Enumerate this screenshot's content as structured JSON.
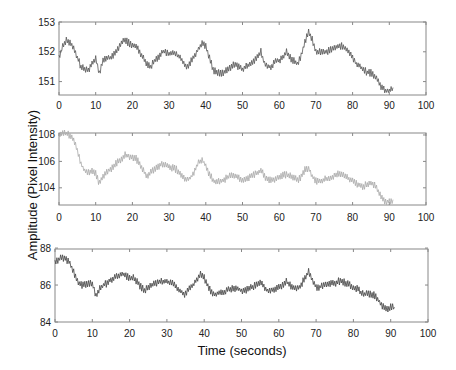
{
  "chart_data": [
    {
      "type": "line",
      "title": "",
      "xlabel": "",
      "ylabel": "",
      "xlim": [
        0,
        100
      ],
      "ylim": [
        150.6,
        153
      ],
      "xticks": [
        0,
        10,
        20,
        30,
        40,
        50,
        60,
        70,
        80,
        90,
        100
      ],
      "yticks": [
        151,
        152,
        153
      ],
      "grid": false,
      "color": "#555555",
      "series": [
        {
          "name": "signal-1",
          "x": [
            0,
            1,
            2,
            3,
            4,
            5,
            6,
            7,
            8,
            9,
            10,
            11,
            12,
            13,
            14,
            15,
            16,
            17,
            18,
            19,
            20,
            21,
            22,
            23,
            24,
            25,
            26,
            27,
            28,
            29,
            30,
            31,
            32,
            33,
            34,
            35,
            36,
            37,
            38,
            39,
            40,
            41,
            42,
            43,
            44,
            45,
            46,
            47,
            48,
            49,
            50,
            51,
            52,
            53,
            54,
            55,
            56,
            57,
            58,
            59,
            60,
            61,
            62,
            63,
            64,
            65,
            66,
            67,
            68,
            69,
            70,
            71,
            72,
            73,
            74,
            75,
            76,
            77,
            78,
            79,
            80,
            81,
            82,
            83,
            84,
            85,
            86,
            87,
            88,
            89,
            90,
            91
          ],
          "values": [
            151.8,
            152.2,
            152.4,
            152.3,
            152.1,
            151.8,
            151.5,
            151.4,
            151.4,
            151.6,
            151.8,
            151.3,
            151.7,
            151.8,
            151.8,
            151.9,
            152.1,
            152.3,
            152.4,
            152.3,
            152.2,
            152.2,
            152.0,
            151.8,
            151.6,
            151.5,
            151.7,
            151.8,
            152.0,
            152.0,
            151.9,
            152.0,
            151.9,
            151.8,
            151.6,
            151.5,
            151.7,
            151.9,
            152.1,
            152.3,
            152.2,
            151.8,
            151.4,
            151.3,
            151.3,
            151.3,
            151.4,
            151.5,
            151.6,
            151.5,
            151.4,
            151.5,
            151.6,
            151.7,
            151.8,
            152.0,
            151.6,
            151.5,
            151.5,
            151.7,
            151.7,
            151.8,
            152.0,
            151.8,
            151.7,
            151.6,
            151.9,
            152.3,
            152.7,
            152.4,
            152.0,
            152.0,
            152.0,
            152.0,
            152.1,
            152.1,
            152.2,
            152.2,
            152.1,
            152.0,
            151.8,
            151.6,
            151.5,
            151.4,
            151.3,
            151.3,
            151.2,
            151.0,
            150.8,
            150.7,
            150.7,
            150.8
          ]
        }
      ]
    },
    {
      "type": "line",
      "title": "",
      "xlabel": "",
      "ylabel": "",
      "xlim": [
        0,
        100
      ],
      "ylim": [
        102.8,
        108.2
      ],
      "xticks": [
        0,
        10,
        20,
        30,
        40,
        50,
        60,
        70,
        80,
        90,
        100
      ],
      "yticks": [
        104,
        106,
        108
      ],
      "grid": false,
      "color": "#aaaaaa",
      "series": [
        {
          "name": "signal-2",
          "x": [
            0,
            1,
            2,
            3,
            4,
            5,
            6,
            7,
            8,
            9,
            10,
            11,
            12,
            13,
            14,
            15,
            16,
            17,
            18,
            19,
            20,
            21,
            22,
            23,
            24,
            25,
            26,
            27,
            28,
            29,
            30,
            31,
            32,
            33,
            34,
            35,
            36,
            37,
            38,
            39,
            40,
            41,
            42,
            43,
            44,
            45,
            46,
            47,
            48,
            49,
            50,
            51,
            52,
            53,
            54,
            55,
            56,
            57,
            58,
            59,
            60,
            61,
            62,
            63,
            64,
            65,
            66,
            67,
            68,
            69,
            70,
            71,
            72,
            73,
            74,
            75,
            76,
            77,
            78,
            79,
            80,
            81,
            82,
            83,
            84,
            85,
            86,
            87,
            88,
            89,
            90,
            91
          ],
          "values": [
            108.0,
            108.1,
            108.1,
            108.0,
            107.6,
            106.8,
            105.8,
            105.3,
            105.2,
            105.3,
            105.1,
            104.3,
            104.9,
            105.2,
            105.4,
            105.7,
            106.0,
            106.2,
            106.5,
            106.4,
            106.3,
            106.2,
            105.8,
            105.3,
            104.9,
            105.2,
            105.4,
            105.6,
            105.8,
            105.7,
            105.6,
            105.5,
            105.4,
            105.1,
            104.8,
            104.6,
            104.8,
            105.3,
            105.9,
            106.1,
            105.7,
            105.0,
            104.6,
            104.4,
            104.5,
            104.6,
            104.8,
            105.0,
            104.9,
            104.7,
            104.6,
            104.7,
            104.8,
            105.0,
            105.1,
            105.3,
            104.9,
            104.6,
            104.6,
            104.7,
            104.8,
            105.0,
            105.0,
            104.9,
            104.8,
            104.6,
            104.8,
            105.4,
            105.5,
            104.9,
            104.5,
            104.5,
            104.6,
            104.7,
            104.8,
            104.9,
            105.1,
            105.0,
            104.9,
            104.7,
            104.5,
            104.3,
            104.2,
            104.1,
            104.3,
            104.4,
            104.2,
            103.7,
            103.2,
            102.9,
            103.0,
            103.1
          ]
        }
      ]
    },
    {
      "type": "line",
      "title": "",
      "xlabel": "Time (seconds)",
      "ylabel": "",
      "xlim": [
        0,
        100
      ],
      "ylim": [
        84,
        88
      ],
      "xticks": [
        0,
        10,
        20,
        30,
        40,
        50,
        60,
        70,
        80,
        90,
        100
      ],
      "yticks": [
        84,
        86,
        88
      ],
      "grid": false,
      "color": "#444444",
      "series": [
        {
          "name": "signal-3",
          "x": [
            0,
            1,
            2,
            3,
            4,
            5,
            6,
            7,
            8,
            9,
            10,
            11,
            12,
            13,
            14,
            15,
            16,
            17,
            18,
            19,
            20,
            21,
            22,
            23,
            24,
            25,
            26,
            27,
            28,
            29,
            30,
            31,
            32,
            33,
            34,
            35,
            36,
            37,
            38,
            39,
            40,
            41,
            42,
            43,
            44,
            45,
            46,
            47,
            48,
            49,
            50,
            51,
            52,
            53,
            54,
            55,
            56,
            57,
            58,
            59,
            60,
            61,
            62,
            63,
            64,
            65,
            66,
            67,
            68,
            69,
            70,
            71,
            72,
            73,
            74,
            75,
            76,
            77,
            78,
            79,
            80,
            81,
            82,
            83,
            84,
            85,
            86,
            87,
            88,
            89,
            90,
            91
          ],
          "values": [
            87.2,
            87.4,
            87.5,
            87.4,
            87.2,
            86.7,
            86.2,
            86.0,
            86.0,
            86.1,
            86.1,
            85.4,
            85.8,
            86.0,
            86.1,
            86.3,
            86.4,
            86.5,
            86.6,
            86.5,
            86.4,
            86.4,
            86.2,
            85.9,
            85.7,
            85.9,
            86.0,
            86.1,
            86.2,
            86.2,
            86.2,
            86.1,
            86.1,
            85.8,
            85.6,
            85.5,
            85.8,
            86.0,
            86.3,
            86.6,
            86.4,
            85.9,
            85.6,
            85.5,
            85.6,
            85.6,
            85.7,
            85.8,
            85.8,
            85.8,
            85.7,
            85.7,
            85.8,
            85.9,
            86.0,
            86.2,
            85.9,
            85.7,
            85.7,
            85.8,
            85.9,
            86.0,
            86.2,
            86.0,
            85.9,
            85.8,
            86.0,
            86.4,
            86.7,
            86.3,
            85.9,
            85.9,
            86.0,
            86.0,
            86.1,
            86.1,
            86.2,
            86.2,
            86.1,
            86.0,
            85.9,
            85.8,
            85.6,
            85.5,
            85.5,
            85.5,
            85.4,
            85.1,
            84.8,
            84.7,
            84.8,
            84.8
          ]
        }
      ]
    }
  ],
  "shared": {
    "ylabel": "Amplitude (Pixel Intensity)",
    "xlabel": "Time (seconds)"
  },
  "panels": [
    {
      "box": [
        59,
        22,
        426,
        95
      ],
      "xlabel_y": 105,
      "ytick_labels": [
        "153",
        "152",
        "151"
      ]
    },
    {
      "box": [
        59,
        133,
        426,
        205
      ],
      "xlabel_y": 217,
      "ytick_labels": [
        "108",
        "106",
        "104"
      ]
    },
    {
      "box": [
        55,
        249,
        428,
        322
      ],
      "xlabel_y": 333,
      "ytick_labels": [
        "88",
        "86",
        "84"
      ]
    }
  ],
  "xtick_labels": [
    "0",
    "10",
    "20",
    "30",
    "40",
    "50",
    "60",
    "70",
    "80",
    "90",
    "100"
  ]
}
